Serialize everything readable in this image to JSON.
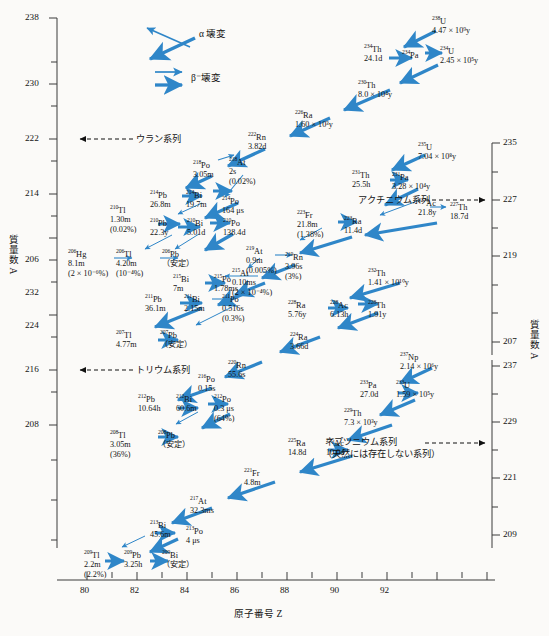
{
  "axes": {
    "x": {
      "title": "原子番号  Z",
      "ticks": [
        "80",
        "82",
        "84",
        "86",
        "88",
        "90",
        "92"
      ]
    },
    "y_left": {
      "title": "質量数  A",
      "ticks": [
        "238",
        "230",
        "222",
        "214",
        "206",
        "232",
        "224",
        "216",
        "208"
      ]
    },
    "y_right": {
      "title": "質量数  A",
      "ticks": [
        "235",
        "227",
        "219",
        "207",
        "237",
        "229",
        "221",
        "209"
      ]
    }
  },
  "legend": {
    "alpha": "α 壊変",
    "beta": "β⁻壊変"
  },
  "series_labels": {
    "uranium": "ウラン系列",
    "actinium": "アクチニウム系列",
    "thorium": "トリウム系列",
    "neptunium_1": "ネプツニウム系列",
    "neptunium_2": "（天然には存在しない系列）"
  },
  "stable_label": "（安定）",
  "nuclides": [
    {
      "id": "U238",
      "sym": "U",
      "a": "238",
      "hl": "4.47 × 10⁹y",
      "pct": ""
    },
    {
      "id": "Th234",
      "sym": "Th",
      "a": "234",
      "hl": "24.1d",
      "pct": ""
    },
    {
      "id": "Pa234",
      "sym": "Pa",
      "a": "234",
      "hl": "",
      "pct": ""
    },
    {
      "id": "U234",
      "sym": "U",
      "a": "234",
      "hl": "2.45 × 10⁵y",
      "pct": ""
    },
    {
      "id": "Th230",
      "sym": "Th",
      "a": "230",
      "hl": "8.0 × 10⁴y",
      "pct": ""
    },
    {
      "id": "Ra226",
      "sym": "Ra",
      "a": "226",
      "hl": "1.60 × 10³y",
      "pct": ""
    },
    {
      "id": "Rn222",
      "sym": "Rn",
      "a": "222",
      "hl": "3.82d",
      "pct": ""
    },
    {
      "id": "Po218",
      "sym": "Po",
      "a": "218",
      "hl": "3.05m",
      "pct": ""
    },
    {
      "id": "At218",
      "sym": "At",
      "a": "218",
      "hl": "2s",
      "pct": "(0.02%)"
    },
    {
      "id": "Pb214",
      "sym": "Pb",
      "a": "214",
      "hl": "26.8m",
      "pct": ""
    },
    {
      "id": "Bi214",
      "sym": "Bi",
      "a": "214",
      "hl": "19.7m",
      "pct": ""
    },
    {
      "id": "Po214",
      "sym": "Po",
      "a": "214",
      "hl": "164 μs",
      "pct": ""
    },
    {
      "id": "Tl210",
      "sym": "Tl",
      "a": "210",
      "hl": "1.30m",
      "pct": "(0.02%)"
    },
    {
      "id": "Pb210",
      "sym": "Pb",
      "a": "210",
      "hl": "22.3y",
      "pct": ""
    },
    {
      "id": "Bi210",
      "sym": "Bi",
      "a": "210",
      "hl": "5.01d",
      "pct": ""
    },
    {
      "id": "Po210",
      "sym": "Po",
      "a": "210",
      "hl": "138.4d",
      "pct": ""
    },
    {
      "id": "Hg206",
      "sym": "Hg",
      "a": "206",
      "hl": "8.1m",
      "pct": "(2 × 10⁻⁶%)"
    },
    {
      "id": "Tl206",
      "sym": "Tl",
      "a": "206",
      "hl": "4.20m",
      "pct": "(10⁻⁴%)"
    },
    {
      "id": "Pb206",
      "sym": "Pb",
      "a": "206",
      "hl": "（安定）",
      "pct": ""
    },
    {
      "id": "U235",
      "sym": "U",
      "a": "235",
      "hl": "7.04 × 10⁸y",
      "pct": ""
    },
    {
      "id": "Th231",
      "sym": "Th",
      "a": "231",
      "hl": "25.5h",
      "pct": ""
    },
    {
      "id": "Pa231",
      "sym": "Pa",
      "a": "231",
      "hl": "3.28 × 10⁴y",
      "pct": ""
    },
    {
      "id": "Ac227",
      "sym": "Ac",
      "a": "227",
      "hl": "21.8y",
      "pct": ""
    },
    {
      "id": "Th227",
      "sym": "Th",
      "a": "227",
      "hl": "18.7d",
      "pct": ""
    },
    {
      "id": "Fr223",
      "sym": "Fr",
      "a": "223",
      "hl": "21.8m",
      "pct": "(1.38%)"
    },
    {
      "id": "Ra223",
      "sym": "Ra",
      "a": "223",
      "hl": "11.4d",
      "pct": ""
    },
    {
      "id": "At219",
      "sym": "At",
      "a": "219",
      "hl": "0.9m",
      "pct": "(0.005%)"
    },
    {
      "id": "Rn219",
      "sym": "Rn",
      "a": "219",
      "hl": "3.96s",
      "pct": "(3%)"
    },
    {
      "id": "At215",
      "sym": "At",
      "a": "215",
      "hl": "0.10ms",
      "pct": "(2 × 10⁻⁴%)"
    },
    {
      "id": "Bi215",
      "sym": "Bi",
      "a": "215",
      "hl": "7m",
      "pct": ""
    },
    {
      "id": "Po215",
      "sym": "Po",
      "a": "215",
      "hl": "1.78ms",
      "pct": ""
    },
    {
      "id": "Pb211",
      "sym": "Pb",
      "a": "211",
      "hl": "36.1m",
      "pct": ""
    },
    {
      "id": "Bi211",
      "sym": "Bi",
      "a": "211",
      "hl": "2.15m",
      "pct": ""
    },
    {
      "id": "Po211",
      "sym": "Po",
      "a": "211",
      "hl": "0.516s",
      "pct": "(0.3%)"
    },
    {
      "id": "Tl207",
      "sym": "Tl",
      "a": "207",
      "hl": "4.77m",
      "pct": ""
    },
    {
      "id": "Pb207",
      "sym": "Pb",
      "a": "207",
      "hl": "（安定）",
      "pct": ""
    },
    {
      "id": "Th232",
      "sym": "Th",
      "a": "232",
      "hl": "1.41 × 10¹⁰y",
      "pct": ""
    },
    {
      "id": "Ra228",
      "sym": "Ra",
      "a": "228",
      "hl": "5.76y",
      "pct": ""
    },
    {
      "id": "Ac228",
      "sym": "Ac",
      "a": "228",
      "hl": "6.13h",
      "pct": ""
    },
    {
      "id": "Th228",
      "sym": "Th",
      "a": "228",
      "hl": "1.91y",
      "pct": ""
    },
    {
      "id": "Ra224",
      "sym": "Ra",
      "a": "224",
      "hl": "3.66d",
      "pct": ""
    },
    {
      "id": "Rn220",
      "sym": "Rn",
      "a": "220",
      "hl": "55.6s",
      "pct": ""
    },
    {
      "id": "Po216",
      "sym": "Po",
      "a": "216",
      "hl": "0.15s",
      "pct": ""
    },
    {
      "id": "Pb212",
      "sym": "Pb",
      "a": "212",
      "hl": "10.64h",
      "pct": ""
    },
    {
      "id": "Bi212",
      "sym": "Bi",
      "a": "212",
      "hl": "60.6m",
      "pct": ""
    },
    {
      "id": "Po212",
      "sym": "Po",
      "a": "212",
      "hl": "0.3 μs",
      "pct": "(64%)"
    },
    {
      "id": "Tl208",
      "sym": "Tl",
      "a": "208",
      "hl": "3.05m",
      "pct": "(36%)"
    },
    {
      "id": "Pb208",
      "sym": "Pb",
      "a": "208",
      "hl": "（安定）",
      "pct": ""
    },
    {
      "id": "Np237",
      "sym": "Np",
      "a": "237",
      "hl": "2.14 × 10⁶y",
      "pct": ""
    },
    {
      "id": "Pa233",
      "sym": "Pa",
      "a": "233",
      "hl": "27.0d",
      "pct": ""
    },
    {
      "id": "U233",
      "sym": "U",
      "a": "233",
      "hl": "1.59 × 10⁵y",
      "pct": ""
    },
    {
      "id": "Th229",
      "sym": "Th",
      "a": "229",
      "hl": "7.3 × 10³y",
      "pct": ""
    },
    {
      "id": "Ra225",
      "sym": "Ra",
      "a": "225",
      "hl": "14.8d",
      "pct": ""
    },
    {
      "id": "Ac225",
      "sym": "Ac",
      "a": "225",
      "hl": "10.0d",
      "pct": ""
    },
    {
      "id": "Fr221",
      "sym": "Fr",
      "a": "221",
      "hl": "4.8m",
      "pct": ""
    },
    {
      "id": "At217",
      "sym": "At",
      "a": "217",
      "hl": "32.3ms",
      "pct": ""
    },
    {
      "id": "Bi213",
      "sym": "Bi",
      "a": "213",
      "hl": "45.6m",
      "pct": ""
    },
    {
      "id": "Po213",
      "sym": "Po",
      "a": "213",
      "hl": "4 μs",
      "pct": ""
    },
    {
      "id": "Tl209",
      "sym": "Tl",
      "a": "209",
      "hl": "2.2m",
      "pct": "(2.2%)"
    },
    {
      "id": "Pb209",
      "sym": "Pb",
      "a": "209",
      "hl": "3.25h",
      "pct": ""
    },
    {
      "id": "Bi209",
      "sym": "Bi",
      "a": "209",
      "hl": "（安定）",
      "pct": ""
    }
  ],
  "colors": {
    "arrow": "#2f86c8",
    "axis": "#3b3b3b",
    "text": "#141414"
  }
}
